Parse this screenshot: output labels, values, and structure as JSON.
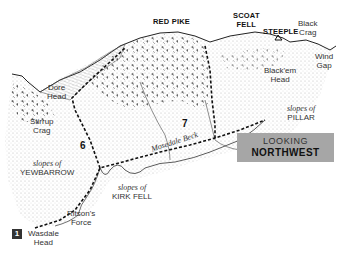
{
  "title_box": {
    "line1": "LOOKING",
    "line2": "NORTHWEST",
    "bg_color": "#a6a6a6"
  },
  "peaks": [
    {
      "name": "RED PIKE"
    },
    {
      "name_line1": "SCOAT",
      "name_line2": "FELL"
    },
    {
      "name": "STEEPLE"
    }
  ],
  "features": {
    "black_crag": {
      "line1": "Black",
      "line2": "Crag"
    },
    "wind_gap": {
      "line1": "Wind",
      "line2": "Gap"
    },
    "blackem_head": {
      "line1": "Black'em",
      "line2": "Head"
    },
    "dore_head": {
      "line1": "Dore",
      "line2": "Head"
    },
    "stirrup_crag": {
      "line1": "Stirrup",
      "line2": "Crag"
    },
    "mosedale_beck": "Mosedale Beck",
    "ritsons_force": {
      "line1": "Ritson's",
      "line2": "Force"
    },
    "wasdale_head": {
      "line1": "Wasdale",
      "line2": "Head"
    }
  },
  "slopes": {
    "pillar": {
      "line1": "slopes of",
      "line2": "PILLAR"
    },
    "yewbarrow": {
      "line1": "slopes of",
      "line2": "YEWBARROW"
    },
    "kirk_fell": {
      "line1": "slopes of",
      "line2": "KIRK FELL"
    }
  },
  "route_numbers": {
    "start": "1",
    "six": "6",
    "seven": "7"
  }
}
